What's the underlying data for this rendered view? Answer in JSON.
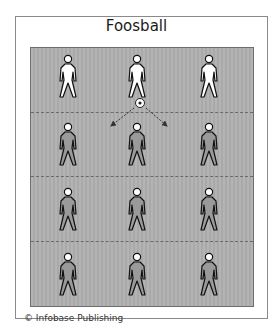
{
  "title": "Foosball",
  "credit": "© Infobase Publishing",
  "colors": {
    "field": "#afafaf",
    "border": "#8a8a8a",
    "player_outline": "#111111"
  },
  "field": {
    "rows": 4,
    "players_per_row": 3,
    "dashed_lines": 3,
    "ball": {
      "icon": "soccer-ball-icon",
      "row": 1,
      "col": 2
    },
    "arrows": [
      "down-left",
      "down-right"
    ]
  }
}
